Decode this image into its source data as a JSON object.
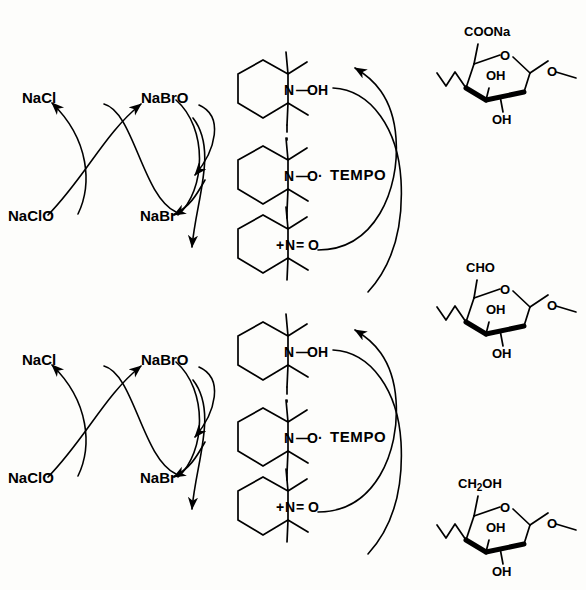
{
  "diagram": {
    "background_color": "#fdfdfb",
    "line_color": "#000000"
  },
  "cycles": [
    {
      "id": "upper-cycle",
      "oxidant_labels": {
        "chloride_product": "NaCl",
        "hypochlorite_reagent": "NaClO",
        "hypobromite": "NaBrO",
        "bromide": "NaBr"
      },
      "catalyst_label": "TEMPO",
      "tempo_species": [
        {
          "id": "hydroxylamine",
          "n_label": "N",
          "bond": "—",
          "o_label": "OH"
        },
        {
          "id": "nitroxyl-radical",
          "n_label": "N",
          "bond": "—",
          "o_label": "O·"
        },
        {
          "id": "oxoammonium",
          "n_label": "N",
          "charge": "+",
          "bond": "=",
          "o_label": "O"
        }
      ],
      "substrate": {
        "id": "uronate-sugar",
        "c6_group": "COONa",
        "ring_oxygen": "O",
        "hydroxyl_c2": "OH",
        "hydroxyl_c3": "OH",
        "glycosidic_oxygen": "O"
      }
    },
    {
      "id": "lower-cycle",
      "oxidant_labels": {
        "chloride_product": "NaCl",
        "hypochlorite_reagent": "NaClO",
        "hypobromite": "NaBrO",
        "bromide": "NaBr"
      },
      "catalyst_label": "TEMPO",
      "tempo_species": [
        {
          "id": "hydroxylamine",
          "n_label": "N",
          "bond": "—",
          "o_label": "OH"
        },
        {
          "id": "nitroxyl-radical",
          "n_label": "N",
          "bond": "—",
          "o_label": "O·"
        },
        {
          "id": "oxoammonium",
          "n_label": "N",
          "charge": "+",
          "bond": "=",
          "o_label": "O"
        }
      ],
      "substrate": {
        "id": "primary-alcohol-sugar",
        "c6_group_main": "CH",
        "c6_group_sub": "2",
        "c6_group_tail": "OH",
        "ring_oxygen": "O",
        "hydroxyl_c2": "OH",
        "hydroxyl_c3": "OH",
        "glycosidic_oxygen": "O"
      }
    }
  ],
  "middle_substrate": {
    "id": "aldehyde-sugar",
    "c6_group": "CHO",
    "ring_oxygen": "O",
    "hydroxyl_c2": "OH",
    "hydroxyl_c3": "OH",
    "glycosidic_oxygen": "O"
  }
}
